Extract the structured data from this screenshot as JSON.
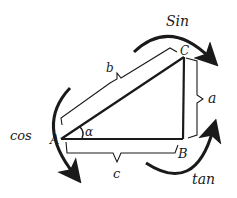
{
  "diagram": {
    "type": "right-triangle-trig-mnemonic",
    "vertices": {
      "A": "A",
      "B": "B",
      "C": "C"
    },
    "sides": {
      "hypotenuse": "b",
      "opposite": "a",
      "adjacent": "c"
    },
    "angle": "α",
    "functions": {
      "sin": "Sin",
      "cos": "cos",
      "tan": "tan"
    },
    "colors": {
      "ink": "#1a1a1a",
      "background": "#ffffff"
    }
  }
}
